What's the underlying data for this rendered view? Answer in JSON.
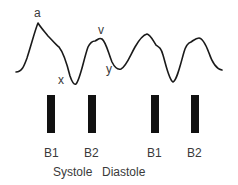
{
  "waveform": {
    "title": "Jugular venous pulse waveform",
    "stroke_color": "#1a1a1a",
    "labels": {
      "a": "a",
      "x": "x",
      "v": "v",
      "y": "y"
    }
  },
  "heart_sounds": {
    "bar_color": "#111111",
    "items": [
      {
        "label": "B1"
      },
      {
        "label": "B2"
      },
      {
        "label": "B1"
      },
      {
        "label": "B2"
      }
    ]
  },
  "phases": {
    "systole": "Systole",
    "diastole": "Diastole"
  }
}
